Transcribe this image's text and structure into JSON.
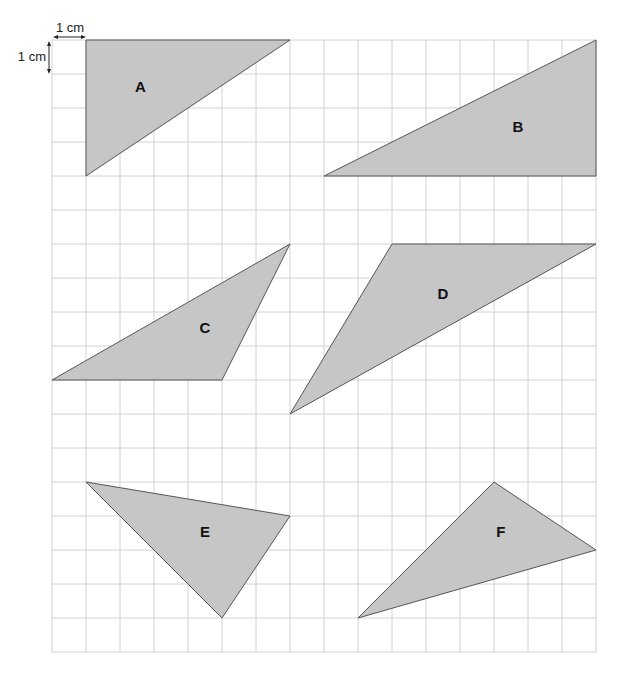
{
  "figure": {
    "type": "grid-triangles",
    "grid": {
      "origin_px": [
        52,
        40
      ],
      "cell_px": 34,
      "columns": 16,
      "rows": 18,
      "line_color": "#d2d2d2"
    },
    "scale": {
      "horizontal_label": "1 cm",
      "vertical_label": "1 cm"
    },
    "fill_color": "#c6c6c6",
    "stroke_color": "#555555",
    "triangles": [
      {
        "label": "A",
        "vertices_grid": [
          [
            1,
            0
          ],
          [
            7,
            0
          ],
          [
            1,
            4
          ]
        ],
        "label_pos_grid": [
          2.6,
          1.4
        ]
      },
      {
        "label": "B",
        "vertices_grid": [
          [
            8,
            4
          ],
          [
            16,
            4
          ],
          [
            16,
            0
          ]
        ],
        "label_pos_grid": [
          13.7,
          2.6
        ]
      },
      {
        "label": "C",
        "vertices_grid": [
          [
            0,
            10
          ],
          [
            5,
            10
          ],
          [
            7,
            6
          ]
        ],
        "label_pos_grid": [
          4.5,
          8.5
        ]
      },
      {
        "label": "D",
        "vertices_grid": [
          [
            10,
            6
          ],
          [
            16,
            6
          ],
          [
            7,
            11
          ]
        ],
        "label_pos_grid": [
          11.5,
          7.5
        ]
      },
      {
        "label": "E",
        "vertices_grid": [
          [
            1,
            13
          ],
          [
            7,
            14
          ],
          [
            5,
            17
          ]
        ],
        "label_pos_grid": [
          4.5,
          14.5
        ]
      },
      {
        "label": "F",
        "vertices_grid": [
          [
            9,
            17
          ],
          [
            13,
            13
          ],
          [
            16,
            15
          ]
        ],
        "label_pos_grid": [
          13.2,
          14.5
        ]
      }
    ]
  }
}
